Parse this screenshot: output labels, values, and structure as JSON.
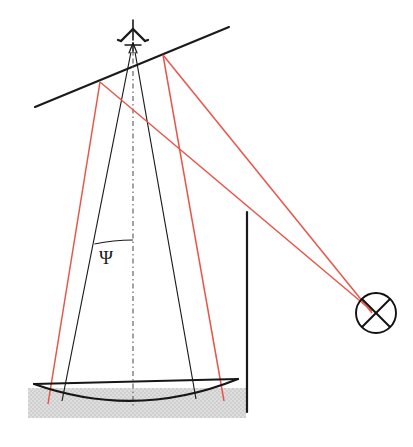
{
  "figure": {
    "background_color": "#ffffff",
    "width": 413,
    "height": 447
  },
  "colors": {
    "beam_black": "#1a1a1a",
    "ray_red": "#e8564a",
    "centerline": "#555555",
    "ground_fill": "#d9d9d9",
    "reflector": "#161616",
    "wall": "#1a1a1a"
  },
  "labels": {
    "psi_angle": "Ψ"
  },
  "icons": {
    "antenna": "antenna-tower-icon",
    "target": "circled-x-target-icon"
  },
  "geometry": {
    "antenna": {
      "mast_x": 133,
      "top_y": 20,
      "base_y": 52
    },
    "slope_line": {
      "x1": 35,
      "y1": 107,
      "x2": 229,
      "y2": 27
    },
    "centerline": {
      "x1": 133,
      "y1": 48,
      "x2": 133,
      "y2": 404,
      "dash": "dash-dot"
    },
    "beam_left": {
      "x1": 131,
      "y1": 52,
      "x2": 62,
      "y2": 400
    },
    "beam_right": {
      "x1": 135,
      "y1": 52,
      "x2": 196,
      "y2": 398
    },
    "psi_arc": {
      "center_x": 133,
      "center_y": 52,
      "radius": 196,
      "label_x": 113,
      "label_y": 257
    },
    "red_vertex_left": {
      "x": 100,
      "y": 82
    },
    "red_vertex_right": {
      "x": 163,
      "y": 55
    },
    "red_rays": [
      {
        "name": "left-vertex-to-reflector",
        "x1": 100,
        "y1": 82,
        "x2": 48,
        "y2": 403
      },
      {
        "name": "right-vertex-to-reflector",
        "x1": 163,
        "y1": 55,
        "x2": 224,
        "y2": 400
      },
      {
        "name": "left-vertex-to-target",
        "x1": 100,
        "y1": 82,
        "x2": 372,
        "y2": 311
      },
      {
        "name": "right-vertex-to-target",
        "x1": 163,
        "y1": 55,
        "x2": 372,
        "y2": 311
      }
    ],
    "reflector": {
      "chord_x1": 34,
      "chord_y1": 384,
      "chord_x2": 238,
      "chord_y2": 380,
      "arc_sag": 22
    },
    "ground_band": {
      "x": 28,
      "y": 388,
      "width": 218,
      "height": 30
    },
    "wall": {
      "x": 247,
      "y1": 212,
      "y2": 412
    },
    "target": {
      "cx": 376,
      "cy": 313,
      "r": 20
    }
  }
}
